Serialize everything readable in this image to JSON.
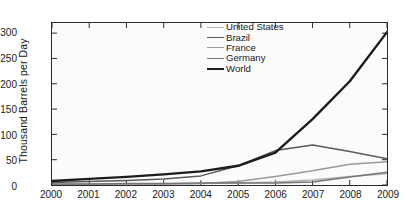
{
  "chart_data": {
    "type": "line",
    "title": "",
    "xlabel": "",
    "ylabel": "Thousand Barrels per Day",
    "x": [
      2000,
      2001,
      2002,
      2003,
      2004,
      2005,
      2006,
      2007,
      2008,
      2009
    ],
    "xtick_labels": [
      "2000",
      "2001",
      "2002",
      "2003",
      "2004",
      "2005",
      "2006",
      "2007",
      "2008",
      "2009"
    ],
    "ytick_labels": [
      "0",
      "50",
      "100",
      "150",
      "200",
      "250",
      "300"
    ],
    "xlim": [
      2000,
      2009
    ],
    "ylim": [
      0,
      320
    ],
    "ytick_values": [
      0,
      50,
      100,
      150,
      200,
      250,
      300
    ],
    "grid": false,
    "legend_position": "top-center",
    "series": [
      {
        "name": "United States",
        "color": "#b4b4b4",
        "width": 1.5,
        "values": [
          1,
          1,
          2,
          2,
          3,
          4,
          6,
          10,
          17,
          22
        ]
      },
      {
        "name": "Brazil",
        "color": "#5a5a5a",
        "width": 1.5,
        "values": [
          5,
          7,
          9,
          12,
          18,
          38,
          68,
          79,
          66,
          52
        ]
      },
      {
        "name": "France",
        "color": "#9a9a9a",
        "width": 1.5,
        "values": [
          1,
          1,
          2,
          2,
          3,
          7,
          17,
          28,
          41,
          46
        ]
      },
      {
        "name": "Germany",
        "color": "#767676",
        "width": 1.5,
        "values": [
          2,
          2,
          3,
          3,
          4,
          4,
          4,
          6,
          16,
          25
        ]
      },
      {
        "name": "World",
        "color": "#1c1c1c",
        "width": 2.4,
        "values": [
          8,
          12,
          16,
          21,
          27,
          38,
          64,
          130,
          205,
          302
        ]
      }
    ]
  }
}
